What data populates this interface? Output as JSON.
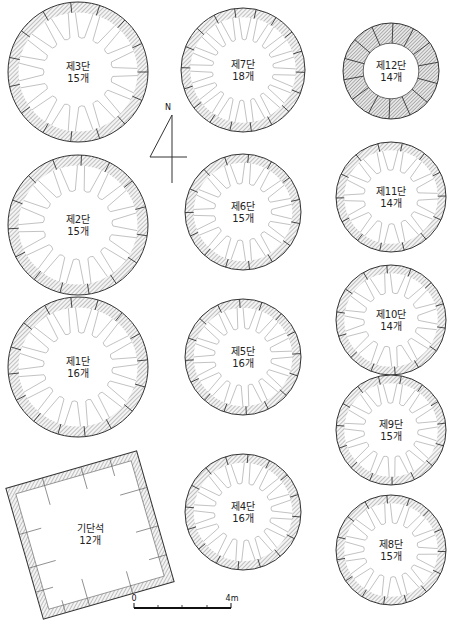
{
  "figure": {
    "type": "archaeological plan drawing",
    "colors": {
      "line": "#333333",
      "hatch": "#888888",
      "background": "#ffffff"
    }
  },
  "north_arrow": {
    "label": "N"
  },
  "scale_bar": {
    "start_label": "0",
    "end_label": "4m",
    "divisions": 4
  },
  "foundation": {
    "name": "기단석",
    "count": "12개",
    "shape": "square",
    "stones": 12
  },
  "tiers": [
    {
      "id": "tier-3",
      "name": "제3단",
      "count": "15개",
      "stones": 15,
      "cx": 78,
      "cy": 72,
      "r": 70
    },
    {
      "id": "tier-2",
      "name": "제2단",
      "count": "15개",
      "stones": 15,
      "cx": 78,
      "cy": 225,
      "r": 70
    },
    {
      "id": "tier-1",
      "name": "제1단",
      "count": "16개",
      "stones": 16,
      "cx": 78,
      "cy": 367,
      "r": 70
    },
    {
      "id": "tier-7",
      "name": "제7단",
      "count": "18개",
      "stones": 18,
      "cx": 243,
      "cy": 70,
      "r": 62
    },
    {
      "id": "tier-6",
      "name": "제6단",
      "count": "15개",
      "stones": 15,
      "cx": 243,
      "cy": 212,
      "r": 58
    },
    {
      "id": "tier-5",
      "name": "제5단",
      "count": "16개",
      "stones": 16,
      "cx": 243,
      "cy": 357,
      "r": 58
    },
    {
      "id": "tier-4",
      "name": "제4단",
      "count": "16개",
      "stones": 16,
      "cx": 243,
      "cy": 512,
      "r": 58
    },
    {
      "id": "tier-12",
      "name": "제12단",
      "count": "14개",
      "stones": 14,
      "cx": 391,
      "cy": 71,
      "r": 48,
      "fully_hatched": true
    },
    {
      "id": "tier-11",
      "name": "제11단",
      "count": "14개",
      "stones": 14,
      "cx": 391,
      "cy": 197,
      "r": 55
    },
    {
      "id": "tier-10",
      "name": "제10단",
      "count": "14개",
      "stones": 14,
      "cx": 391,
      "cy": 320,
      "r": 55
    },
    {
      "id": "tier-9",
      "name": "제9단",
      "count": "15개",
      "stones": 15,
      "cx": 391,
      "cy": 430,
      "r": 55
    },
    {
      "id": "tier-8",
      "name": "제8단",
      "count": "15개",
      "stones": 15,
      "cx": 391,
      "cy": 550,
      "r": 55
    }
  ]
}
